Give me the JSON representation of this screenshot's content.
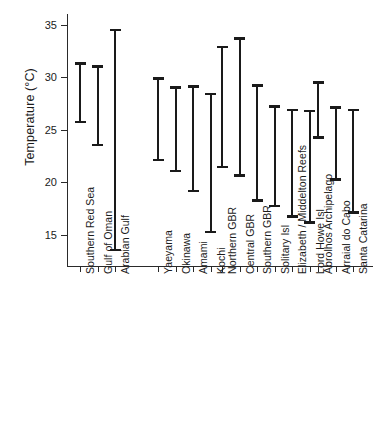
{
  "chart_data": {
    "type": "bar",
    "subtype": "range-interval",
    "title": "",
    "xlabel": "",
    "ylabel": "Temperature (°C)",
    "ylim": [
      12,
      36
    ],
    "yticks": [
      15,
      20,
      25,
      30,
      35
    ],
    "ytick_labels": [
      "15",
      "20",
      "25",
      "30",
      "35"
    ],
    "grid": false,
    "legend": false,
    "legend_position": "none",
    "categories": [
      "Southern Red Sea",
      "Gulf of Oman",
      "Arabian Gulf",
      "Yaeyama",
      "Okinawa",
      "Amami",
      "Kochi",
      "Northern GBR",
      "Central GBR",
      "Southern GBR",
      "Solitary Isl",
      "Elizabeth / Middelton Reefs",
      "Lord Howe Isl",
      "Abrolhos Archipelago",
      "Arraial do Cabo",
      "Santa Catarina"
    ],
    "series": [
      {
        "name": "Temperature range minimum",
        "values": [
          25.6,
          23.4,
          13.4,
          22.0,
          20.9,
          19.0,
          15.1,
          21.3,
          20.5,
          18.1,
          17.6,
          16.6,
          16.0,
          24.1,
          20.1,
          17.0
        ]
      },
      {
        "name": "Temperature range maximum",
        "values": [
          31.4,
          31.1,
          34.6,
          30.0,
          29.1,
          29.2,
          28.5,
          33.0,
          33.8,
          29.3,
          27.3,
          27.0,
          26.9,
          29.6,
          27.2,
          27.0
        ]
      }
    ],
    "groups": [
      {
        "name": "Red Sea / Arabian",
        "members": [
          "Southern Red Sea",
          "Gulf of Oman",
          "Arabian Gulf"
        ]
      },
      {
        "name": "Japan",
        "members": [
          "Yaeyama",
          "Okinawa",
          "Amami",
          "Kochi"
        ]
      },
      {
        "name": "Australia",
        "members": [
          "Northern GBR",
          "Central GBR",
          "Southern GBR",
          "Solitary Isl",
          "Elizabeth / Middelton Reefs",
          "Lord Howe Isl"
        ]
      },
      {
        "name": "Brazil",
        "members": [
          "Abrolhos Archipelago",
          "Arraial do Cabo",
          "Santa Catarina"
        ]
      }
    ]
  },
  "axis": {
    "y_title": "Temperature (°C)"
  },
  "colors": {
    "bar": "#1a1a1a",
    "axis": "#2a2a2a",
    "text": "#1b1b1b",
    "background": "#ffffff"
  }
}
